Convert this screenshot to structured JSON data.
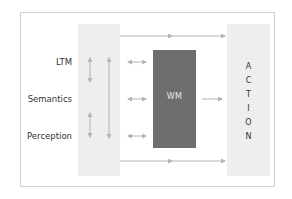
{
  "diagram": {
    "left_labels": [
      "LTM",
      "Semantics",
      "Perception"
    ],
    "center_box": {
      "label": "WM",
      "color": "#6e6e6e"
    },
    "right_box": {
      "label": "ACTION",
      "letters": [
        "A",
        "C",
        "T",
        "I",
        "O",
        "N"
      ],
      "color": "#eeeeee"
    },
    "left_column_color": "#eeeeee",
    "arrow_color": "#b4b4b4",
    "connections": [
      {
        "from": "left-column",
        "to": "ACTION",
        "type": "one-way",
        "position": "top"
      },
      {
        "from": "left-column",
        "to": "ACTION",
        "type": "one-way",
        "position": "bottom"
      },
      {
        "from": "LTM",
        "to": "WM",
        "type": "bidirectional"
      },
      {
        "from": "Semantics",
        "to": "WM",
        "type": "bidirectional"
      },
      {
        "from": "Perception",
        "to": "WM",
        "type": "bidirectional"
      },
      {
        "from": "WM",
        "to": "ACTION",
        "type": "one-way"
      },
      {
        "from": "LTM",
        "to": "Semantics",
        "type": "bidirectional-vertical"
      },
      {
        "from": "Semantics",
        "to": "Perception",
        "type": "bidirectional-vertical"
      },
      {
        "from": "LTM",
        "to": "Perception",
        "type": "one-way-vertical"
      }
    ]
  }
}
